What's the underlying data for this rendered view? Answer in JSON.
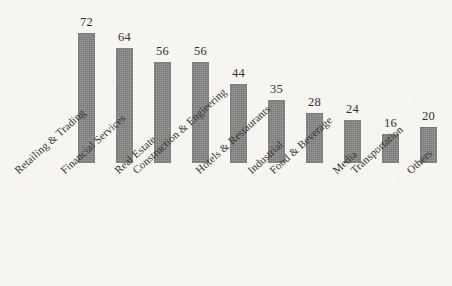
{
  "chart_data": {
    "type": "bar",
    "title": "",
    "subtitle": "",
    "xlabel": "",
    "ylabel": "",
    "ylim": [
      0,
      72
    ],
    "grid": false,
    "legend": "none",
    "axis_visible": false,
    "value_labels_shown": true,
    "label_rotation_deg": -42,
    "bar_color": "#838382",
    "background_color": "#f6f5f2",
    "text_color": "#35332f",
    "categories": [
      "Retailing & Trading",
      "Financial Services",
      "Real Estate",
      "Construction & Engieering",
      "Hotels & Restaurants",
      "Industrial",
      "Food & Beverage",
      "Media",
      "Transportation",
      "Others"
    ],
    "values": [
      72,
      64,
      56,
      56,
      44,
      35,
      28,
      24,
      16,
      20
    ],
    "bars": [
      {
        "category": "Retailing & Trading",
        "value": 72,
        "value_label": "72",
        "x": 78,
        "bar_height_px": 130
      },
      {
        "category": "Financial Services",
        "value": 64,
        "value_label": "64",
        "x": 116,
        "bar_height_px": 115
      },
      {
        "category": "Real Estate",
        "value": 56,
        "value_label": "56",
        "x": 154,
        "bar_height_px": 101
      },
      {
        "category": "Construction & Engieering",
        "value": 56,
        "value_label": "56",
        "x": 192,
        "bar_height_px": 101
      },
      {
        "category": "Hotels & Restaurants",
        "value": 44,
        "value_label": "44",
        "x": 230,
        "bar_height_px": 79
      },
      {
        "category": "Industrial",
        "value": 35,
        "value_label": "35",
        "x": 268,
        "bar_height_px": 63
      },
      {
        "category": "Food & Beverage",
        "value": 28,
        "value_label": "28",
        "x": 306,
        "bar_height_px": 50
      },
      {
        "category": "Media",
        "value": 24,
        "value_label": "24",
        "x": 344,
        "bar_height_px": 43
      },
      {
        "category": "Transportation",
        "value": 16,
        "value_label": "16",
        "x": 382,
        "bar_height_px": 29
      },
      {
        "category": "Others",
        "value": 20,
        "value_label": "20",
        "x": 420,
        "bar_height_px": 36
      }
    ],
    "category_label_positions": [
      {
        "label": "Retailing & Trading",
        "x": 12
      },
      {
        "label": "Financial Services",
        "x": 58
      },
      {
        "label": "Real Estate",
        "x": 112
      },
      {
        "label": "Construction & Engieering",
        "x": 130
      },
      {
        "label": "Hotels & Restaurants",
        "x": 193
      },
      {
        "label": "Industrial",
        "x": 245
      },
      {
        "label": "Food & Beverage",
        "x": 267
      },
      {
        "label": "Media",
        "x": 330
      },
      {
        "label": "Transportation",
        "x": 348
      },
      {
        "label": "Others",
        "x": 404
      }
    ]
  }
}
